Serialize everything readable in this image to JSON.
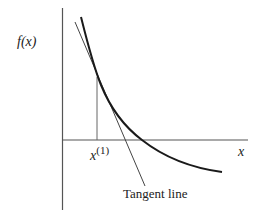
{
  "diagram": {
    "y_axis_label": "f(x)",
    "x_axis_label": "x",
    "point_label_base": "x",
    "point_label_sup": "(1)",
    "tangent_label": "Tangent line",
    "colors": {
      "axis": "#555555",
      "curve": "#1a1a1a",
      "tangent": "#444444",
      "text": "#222222"
    }
  }
}
